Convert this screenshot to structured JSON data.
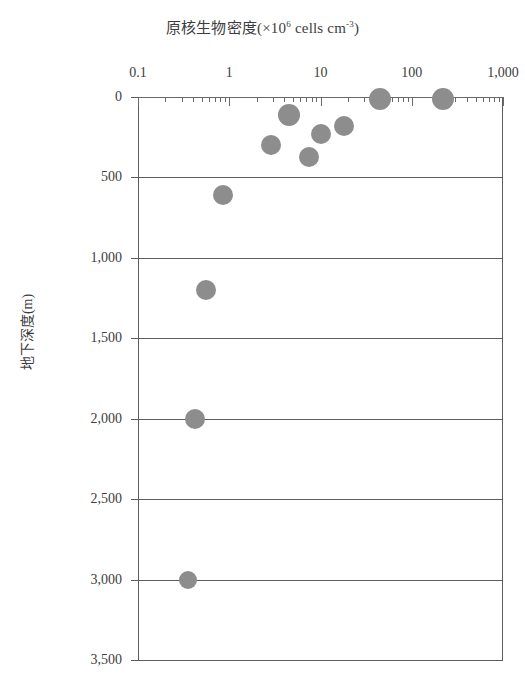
{
  "chart_data": {
    "type": "scatter",
    "title_main": "原核生物密度(×10",
    "title_sup": "6",
    "title_tail": " cells cm",
    "title_sup2": "-3",
    "title_end": ")",
    "xlabel": "原核生物密度(×10^6 cells cm^-3)",
    "ylabel": "地下深度(m)",
    "xscale": "log",
    "yscale": "linear",
    "xlim": [
      0.1,
      1000
    ],
    "ylim": [
      0,
      3500
    ],
    "y_inverted": true,
    "grid": "horizontal",
    "legend": "none",
    "xticks": [
      {
        "value": 0.1,
        "label": "0.1"
      },
      {
        "value": 1,
        "label": "1"
      },
      {
        "value": 10,
        "label": "10"
      },
      {
        "value": 100,
        "label": "100"
      },
      {
        "value": 1000,
        "label": "1,000"
      }
    ],
    "yticks": [
      {
        "value": 0,
        "label": "0"
      },
      {
        "value": 500,
        "label": "500"
      },
      {
        "value": 1000,
        "label": "1,000"
      },
      {
        "value": 1500,
        "label": "1,500"
      },
      {
        "value": 2000,
        "label": "2,000"
      },
      {
        "value": 2500,
        "label": "2,500"
      },
      {
        "value": 3000,
        "label": "3,000"
      },
      {
        "value": 3500,
        "label": "3,500"
      }
    ],
    "marker": {
      "shape": "circle",
      "color": "#8d8d8d",
      "size_px": 21
    },
    "points": [
      {
        "density": 220,
        "depth": 10,
        "r": 11
      },
      {
        "density": 45,
        "depth": 10,
        "r": 11
      },
      {
        "density": 4.5,
        "depth": 110,
        "r": 11
      },
      {
        "density": 18,
        "depth": 180,
        "r": 10
      },
      {
        "density": 10,
        "depth": 230,
        "r": 10
      },
      {
        "density": 2.9,
        "depth": 300,
        "r": 10
      },
      {
        "density": 7.5,
        "depth": 375,
        "r": 10
      },
      {
        "density": 0.85,
        "depth": 610,
        "r": 10
      },
      {
        "density": 0.55,
        "depth": 1200,
        "r": 10
      },
      {
        "density": 0.42,
        "depth": 2000,
        "r": 10
      },
      {
        "density": 0.35,
        "depth": 3000,
        "r": 9
      }
    ]
  }
}
